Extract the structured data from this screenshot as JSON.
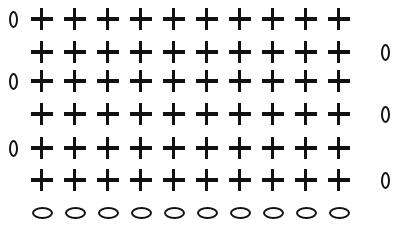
{
  "diagram": {
    "type": "crochet-stitch-chart",
    "stitch_symbols": {
      "plus": "single-crochet",
      "vertical_oval": "turning-chain",
      "horizontal_oval": "foundation-chain"
    },
    "columns": 10,
    "rows": [
      {
        "index": 1,
        "stitches": 10,
        "turning_chain_side": "left"
      },
      {
        "index": 2,
        "stitches": 10,
        "turning_chain_side": "right"
      },
      {
        "index": 3,
        "stitches": 10,
        "turning_chain_side": "left"
      },
      {
        "index": 4,
        "stitches": 10,
        "turning_chain_side": "right"
      },
      {
        "index": 5,
        "stitches": 10,
        "turning_chain_side": "left"
      },
      {
        "index": 6,
        "stitches": 10,
        "turning_chain_side": "right"
      }
    ],
    "foundation_chain_count": 10,
    "colors": {
      "ink": "#111111",
      "background": "#ffffff"
    }
  }
}
